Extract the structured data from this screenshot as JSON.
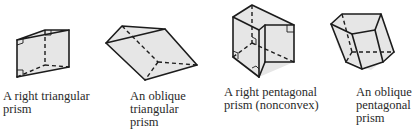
{
  "figure": {
    "items": [
      {
        "id": "right-triangular-prism",
        "caption": "A right triangular\nprism"
      },
      {
        "id": "oblique-triangular-prism",
        "caption": "An oblique\ntriangular\nprism"
      },
      {
        "id": "right-pentagonal-prism-nonconvex",
        "caption": "A right pentagonal\nprism (nonconvex)"
      },
      {
        "id": "oblique-pentagonal-prism",
        "caption": "An oblique\npentagonal\nprism"
      }
    ]
  },
  "colors": {
    "face_fill": "#e6e6e6",
    "edge": "#1c1c1c",
    "background": "#ffffff"
  }
}
